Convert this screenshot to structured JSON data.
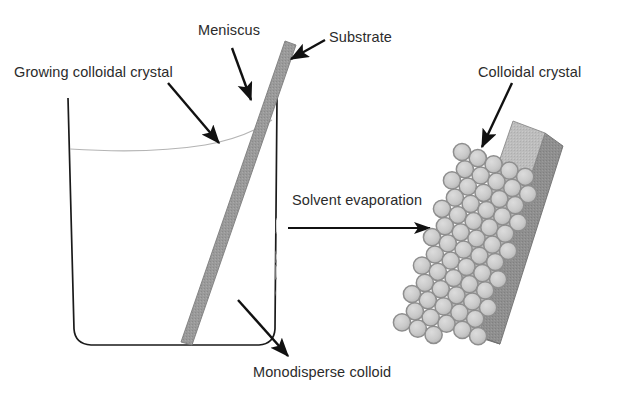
{
  "figure": {
    "background": "#ffffff"
  },
  "labels": {
    "growing_crystal": "Growing colloidal crystal",
    "meniscus": "Meniscus",
    "substrate": "Substrate",
    "colloidal_crystal": "Colloidal crystal",
    "solvent_evaporation": "Solvent evaporation",
    "monodisperse_colloid": "Monodisperse colloid"
  },
  "colors": {
    "text": "#2b2b2b",
    "outline": "#1a1a1a",
    "sphere_fill": "#c9c9c9",
    "sphere_stroke": "#8e8e8e",
    "substrate_fill": "#9a9a9a",
    "substrate_stroke": "#7d7d7d",
    "slab_top_fill": "#bdbdbd",
    "slab_side_fill": "#8f8f8f",
    "meniscus_line": "#b4b4b4",
    "arrow": "#111111"
  },
  "elements": {
    "beaker": {
      "name": "beaker",
      "left_wall_x": 68,
      "right_wall_x": 277,
      "top_y": 98,
      "bottom_y": 345
    },
    "meniscus_curve": {
      "name": "meniscus-curve",
      "left_y": 149,
      "right_y": 133
    },
    "substrate_bar": {
      "name": "substrate-bar-in-beaker",
      "top_x": 290,
      "top_y": 42,
      "bottom_x": 186,
      "bottom_y": 344,
      "width": 11
    },
    "crystal_slab": {
      "name": "colloidal-crystal-slab",
      "tilt_degrees": 28,
      "sphere_rows": 13,
      "sphere_cols": 5
    }
  },
  "arrows": [
    {
      "name": "arrow-growing-colloidal-crystal",
      "x1": 168,
      "y1": 83,
      "x2": 219,
      "y2": 143
    },
    {
      "name": "arrow-meniscus",
      "x1": 232,
      "y1": 48,
      "x2": 251,
      "y2": 100
    },
    {
      "name": "arrow-substrate",
      "x1": 325,
      "y1": 40,
      "x2": 291,
      "y2": 59
    },
    {
      "name": "arrow-colloidal-crystal",
      "x1": 512,
      "y1": 83,
      "x2": 482,
      "y2": 147
    },
    {
      "name": "arrow-monodisperse-colloid",
      "x1": 238,
      "y1": 300,
      "x2": 288,
      "y2": 356
    },
    {
      "name": "arrow-solvent-evaporation",
      "x1": 288,
      "y1": 228,
      "x2": 432,
      "y2": 228
    }
  ],
  "dispersed_particles": [
    [
      89,
      203
    ],
    [
      121,
      196
    ],
    [
      152,
      199
    ],
    [
      186,
      194
    ],
    [
      216,
      186
    ],
    [
      247,
      200
    ],
    [
      268,
      208
    ],
    [
      104,
      213
    ],
    [
      135,
      221
    ],
    [
      169,
      216
    ],
    [
      201,
      207
    ],
    [
      229,
      213
    ],
    [
      259,
      222
    ],
    [
      86,
      230
    ],
    [
      117,
      235
    ],
    [
      148,
      244
    ],
    [
      179,
      231
    ],
    [
      211,
      237
    ],
    [
      241,
      246
    ],
    [
      264,
      238
    ],
    [
      95,
      252
    ],
    [
      126,
      258
    ],
    [
      157,
      250
    ],
    [
      188,
      262
    ],
    [
      218,
      255
    ],
    [
      249,
      265
    ],
    [
      271,
      257
    ],
    [
      82,
      272
    ],
    [
      113,
      266
    ],
    [
      144,
      277
    ],
    [
      175,
      270
    ],
    [
      206,
      279
    ],
    [
      236,
      272
    ],
    [
      262,
      281
    ],
    [
      92,
      290
    ],
    [
      123,
      296
    ],
    [
      154,
      288
    ],
    [
      185,
      299
    ],
    [
      215,
      291
    ],
    [
      245,
      300
    ],
    [
      268,
      293
    ],
    [
      101,
      311
    ],
    [
      132,
      305
    ],
    [
      163,
      315
    ],
    [
      194,
      308
    ],
    [
      224,
      317
    ],
    [
      253,
      310
    ],
    [
      110,
      328
    ],
    [
      141,
      331
    ],
    [
      172,
      325
    ],
    [
      203,
      333
    ],
    [
      233,
      327
    ],
    [
      258,
      332
    ],
    [
      88,
      186
    ],
    [
      236,
      190
    ],
    [
      276,
      226
    ],
    [
      274,
      272
    ]
  ],
  "crystal_cluster_particles": [
    [
      214,
      145
    ],
    [
      228,
      143
    ],
    [
      243,
      141
    ],
    [
      256,
      150
    ],
    [
      208,
      158
    ],
    [
      222,
      156
    ],
    [
      236,
      154
    ],
    [
      250,
      162
    ],
    [
      263,
      160
    ],
    [
      215,
      170
    ],
    [
      229,
      168
    ],
    [
      243,
      166
    ],
    [
      257,
      174
    ],
    [
      209,
      182
    ],
    [
      223,
      180
    ],
    [
      237,
      178
    ],
    [
      251,
      186
    ],
    [
      231,
      192
    ],
    [
      245,
      190
    ],
    [
      216,
      194
    ]
  ]
}
